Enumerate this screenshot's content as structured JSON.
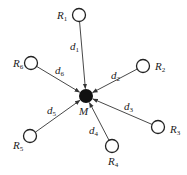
{
  "diagram": {
    "center": {
      "label": "M",
      "x": 86,
      "y": 96,
      "r": 7,
      "fill": "#111111",
      "label_x": 79,
      "label_y": 115
    },
    "nodes": [
      {
        "id": "R1",
        "label": "R",
        "sub": "1",
        "x": 79,
        "y": 15,
        "lx": 57,
        "ly": 19
      },
      {
        "id": "R2",
        "label": "R",
        "sub": "2",
        "x": 143,
        "y": 66,
        "lx": 155,
        "ly": 70
      },
      {
        "id": "R3",
        "label": "R",
        "sub": "3",
        "x": 158,
        "y": 127,
        "lx": 170,
        "ly": 133
      },
      {
        "id": "R4",
        "label": "R",
        "sub": "4",
        "x": 112,
        "y": 146,
        "lx": 108,
        "ly": 165
      },
      {
        "id": "R5",
        "label": "R",
        "sub": "5",
        "x": 30,
        "y": 136,
        "lx": 13,
        "ly": 149
      },
      {
        "id": "R6",
        "label": "R",
        "sub": "6",
        "x": 31,
        "y": 63,
        "lx": 13,
        "ly": 67
      }
    ],
    "edges": [
      {
        "label": "d",
        "sub": "1",
        "from": "R1",
        "lx": 70,
        "ly": 50
      },
      {
        "label": "d",
        "sub": "2",
        "from": "R2",
        "lx": 111,
        "ly": 79
      },
      {
        "label": "d",
        "sub": "3",
        "from": "R3",
        "lx": 124,
        "ly": 110
      },
      {
        "label": "d",
        "sub": "4",
        "from": "R4",
        "lx": 89,
        "ly": 134
      },
      {
        "label": "d",
        "sub": "5",
        "from": "R5",
        "lx": 47,
        "ly": 114
      },
      {
        "label": "d",
        "sub": "6",
        "from": "R6",
        "lx": 55,
        "ly": 74
      }
    ],
    "node_radius": 6.5,
    "stroke": "#333333"
  }
}
